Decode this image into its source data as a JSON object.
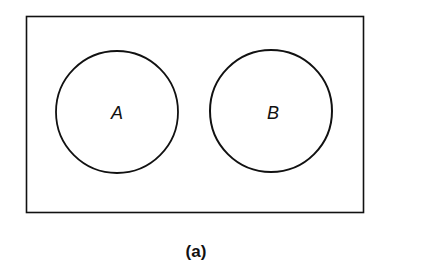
{
  "diagram": {
    "type": "venn",
    "universe": {
      "label": ""
    },
    "sets": [
      {
        "label": "A"
      },
      {
        "label": "B"
      }
    ],
    "relationship": "disjoint",
    "caption": "(a)"
  }
}
